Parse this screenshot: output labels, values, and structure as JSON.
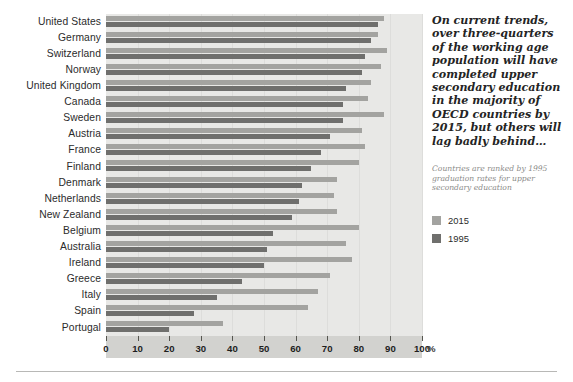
{
  "chart_data": {
    "type": "bar",
    "orientation": "horizontal",
    "title": "",
    "xlabel": "%",
    "ylabel": "",
    "xlim": [
      0,
      100
    ],
    "xticks": [
      0,
      10,
      20,
      30,
      40,
      50,
      60,
      70,
      80,
      90,
      100
    ],
    "grid": true,
    "legend_position": "right",
    "categories": [
      "United States",
      "Germany",
      "Switzerland",
      "Norway",
      "United Kingdom",
      "Canada",
      "Sweden",
      "Austria",
      "France",
      "Finland",
      "Denmark",
      "Netherlands",
      "New Zealand",
      "Belgium",
      "Australia",
      "Ireland",
      "Greece",
      "Italy",
      "Spain",
      "Portugal"
    ],
    "series": [
      {
        "name": "2015",
        "color": "#a3a3a0",
        "values": [
          88,
          86,
          89,
          87,
          84,
          83,
          88,
          81,
          82,
          80,
          73,
          72,
          73,
          80,
          76,
          78,
          71,
          67,
          64,
          37
        ]
      },
      {
        "name": "1995",
        "color": "#6f6f6d",
        "values": [
          86,
          84,
          82,
          81,
          76,
          75,
          75,
          71,
          68,
          65,
          62,
          61,
          59,
          53,
          51,
          50,
          43,
          35,
          28,
          20
        ]
      }
    ],
    "annotation": "On current trends, over three-quarters of the working age population will have completed upper secondary education in the majority of OECD countries by 2015, but others will lag badly behind…",
    "caption": "Countries are ranked by 1995 graduation rates for upper secondary education"
  },
  "colors": {
    "series_2015": "#a3a3a0",
    "series_1995": "#6f6f6d",
    "plot_background": "#e8e8e6",
    "axis_band": "#d2d2cf",
    "page_background": "#ffffff"
  }
}
